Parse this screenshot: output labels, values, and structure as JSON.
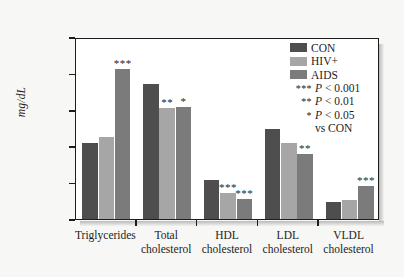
{
  "chart_data": {
    "type": "bar",
    "title": "",
    "xlabel": "",
    "ylabel": "mg/dL",
    "ylim": [
      0,
      250
    ],
    "yticks": [
      0,
      50,
      100,
      150,
      200,
      250
    ],
    "grid": false,
    "legend_position": "top-right",
    "categories": [
      "Triglycerides",
      "Total cholesterol",
      "HDL cholesterol",
      "LDL cholesterol",
      "VLDL cholesterol"
    ],
    "category_lines": [
      {
        "line1": "Triglycerides",
        "line2": ""
      },
      {
        "line1": "Total",
        "line2": "cholesterol"
      },
      {
        "line1": "HDL",
        "line2": "cholesterol"
      },
      {
        "line1": "LDL",
        "line2": "cholesterol"
      },
      {
        "line1": "VLDL",
        "line2": "cholesterol"
      }
    ],
    "series": [
      {
        "name": "CON",
        "color": "#4e4e4e",
        "values": [
          105,
          186,
          54,
          124,
          24
        ]
      },
      {
        "name": "HIV+",
        "color": "#a6a6a6",
        "values": [
          113,
          153,
          36,
          105,
          26
        ]
      },
      {
        "name": "AIDS",
        "color": "#7b7b7b",
        "values": [
          206,
          154,
          28,
          89,
          45
        ]
      }
    ],
    "annotations": [
      {
        "category": "Triglycerides",
        "series": "AIDS",
        "marker": "***"
      },
      {
        "category": "Total cholesterol",
        "series": "HIV+",
        "marker": "**"
      },
      {
        "category": "Total cholesterol",
        "series": "AIDS",
        "marker": "*"
      },
      {
        "category": "HDL cholesterol",
        "series": "HIV+",
        "marker": "***"
      },
      {
        "category": "HDL cholesterol",
        "series": "AIDS",
        "marker": "***"
      },
      {
        "category": "LDL cholesterol",
        "series": "AIDS",
        "marker": "**"
      },
      {
        "category": "VLDL cholesterol",
        "series": "AIDS",
        "marker": "***"
      }
    ]
  },
  "legend": {
    "series": [
      {
        "label": "CON",
        "color": "#4e4e4e"
      },
      {
        "label": "HIV+",
        "color": "#a6a6a6"
      },
      {
        "label": "AIDS",
        "color": "#7b7b7b"
      }
    ],
    "pvalues": [
      {
        "stars": "***",
        "text": "P < 0.001",
        "p_italic": "P",
        "rest": " < 0.001"
      },
      {
        "stars": "**",
        "text": "P < 0.01",
        "p_italic": "P",
        "rest": " < 0.01"
      },
      {
        "stars": "*",
        "text": "P < 0.05",
        "p_italic": "P",
        "rest": " < 0.05"
      }
    ],
    "comparison": "vs CON"
  }
}
